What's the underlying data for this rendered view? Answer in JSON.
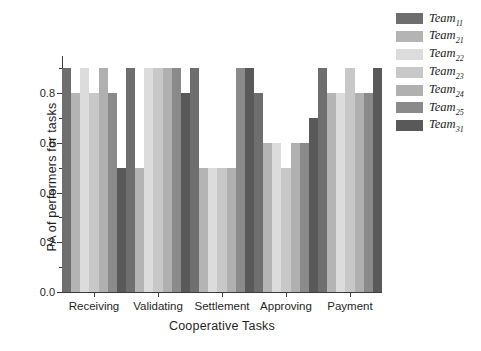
{
  "chart_data": {
    "type": "bar",
    "title": "",
    "xlabel": "Cooperative Tasks",
    "ylabel": "PA of performers for tasks",
    "categories": [
      "Receiving",
      "Validating",
      "Settlement",
      "Approving",
      "Payment"
    ],
    "ylim": [
      0.0,
      0.95
    ],
    "yticks": [
      0.0,
      0.2,
      0.4,
      0.6,
      0.8
    ],
    "ytick_labels": [
      "0.0",
      "0.2",
      "0.4",
      "0.6",
      "0.8"
    ],
    "yticks_minor": [
      0.1,
      0.3,
      0.5,
      0.7,
      0.9
    ],
    "grid": false,
    "legend_position": "right",
    "series": [
      {
        "name": "Team",
        "sub": "11",
        "color": "#6e6e6e",
        "values": [
          0.9,
          0.9,
          0.9,
          0.8,
          0.9
        ]
      },
      {
        "name": "Team",
        "sub": "21",
        "color": "#b4b4b4",
        "values": [
          0.8,
          0.5,
          0.5,
          0.6,
          0.8
        ]
      },
      {
        "name": "Team",
        "sub": "22",
        "color": "#dcdcdc",
        "values": [
          0.9,
          0.9,
          0.5,
          0.6,
          0.8
        ]
      },
      {
        "name": "Team",
        "sub": "23",
        "color": "#c8c8c8",
        "values": [
          0.8,
          0.9,
          0.5,
          0.5,
          0.9
        ]
      },
      {
        "name": "Team",
        "sub": "24",
        "color": "#b0b0b0",
        "values": [
          0.9,
          0.9,
          0.5,
          0.6,
          0.8
        ]
      },
      {
        "name": "Team",
        "sub": "25",
        "color": "#8a8a8a",
        "values": [
          0.8,
          0.9,
          0.9,
          0.6,
          0.8
        ]
      },
      {
        "name": "Team",
        "sub": "31",
        "color": "#595959",
        "values": [
          0.5,
          0.8,
          0.9,
          0.7,
          0.9
        ]
      }
    ]
  }
}
